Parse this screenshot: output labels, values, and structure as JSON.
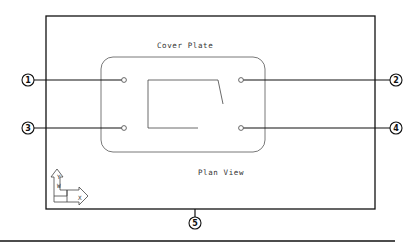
{
  "drawing": {
    "title_label": "Cover Plate",
    "view_label": "Plan View",
    "ucs_icon": {
      "y_label": "Y",
      "w_label": "W",
      "x_label": "X"
    },
    "balloons": [
      {
        "number": "1",
        "target": "top-left-hole"
      },
      {
        "number": "2",
        "target": "top-right-hole"
      },
      {
        "number": "3",
        "target": "bottom-left-hole"
      },
      {
        "number": "4",
        "target": "bottom-right-hole"
      },
      {
        "number": "5",
        "target": "frame-bottom-edge"
      }
    ],
    "colors": {
      "line": "#111111",
      "thin_line": "#555555",
      "background": "#ffffff"
    }
  }
}
